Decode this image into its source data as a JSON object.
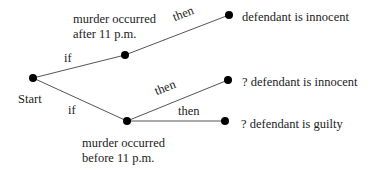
{
  "diagram": {
    "type": "decision-tree",
    "nodes": {
      "start": {
        "label": "Start"
      },
      "after": {
        "label_line1": "murder occurred",
        "label_line2": "after 11 p.m."
      },
      "before": {
        "label_line1": "murder occurred",
        "label_line2": "before 11 p.m."
      },
      "innocent_certain": {
        "label": "defendant is innocent"
      },
      "innocent_uncertain": {
        "label": "? defendant is innocent"
      },
      "guilty_uncertain": {
        "label": "? defendant is guilty"
      }
    },
    "edges": {
      "start_after": {
        "label": "if"
      },
      "start_before": {
        "label": "if"
      },
      "after_innocent": {
        "label": "then"
      },
      "before_innocent": {
        "label": "then"
      },
      "before_guilty": {
        "label": "then"
      }
    },
    "colors": {
      "line": "#555555",
      "node": "#000000",
      "text": "#222222"
    }
  }
}
